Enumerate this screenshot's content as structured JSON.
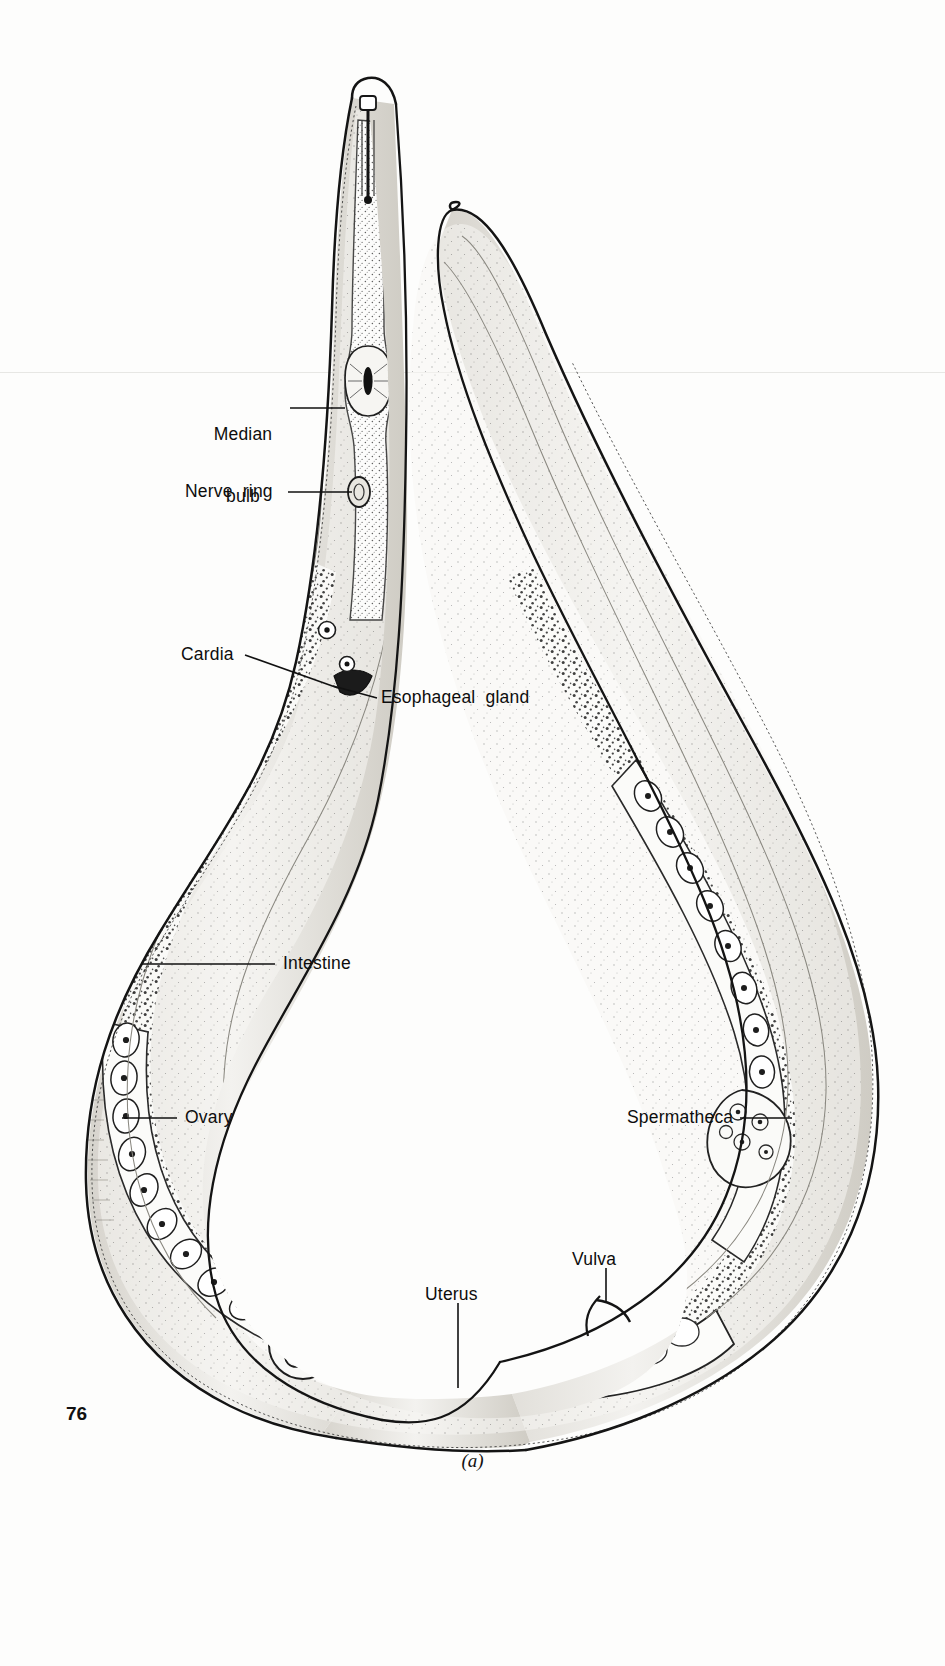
{
  "document": {
    "page_number": "76",
    "figure_caption": "(a)",
    "figure_subject": "female nematode sagittal section"
  },
  "labels": [
    {
      "id": "median-bulb",
      "text_line1": "Median",
      "text_line2": "bulb",
      "x": 213,
      "y": 386,
      "align": "left",
      "leader": {
        "x1": 290,
        "y1": 408,
        "x2": 345,
        "y2": 408
      }
    },
    {
      "id": "nerve-ring",
      "text_line1": "Nerve  ring",
      "text_line2": "",
      "x": 185,
      "y": 482,
      "align": "left",
      "leader": {
        "x1": 288,
        "y1": 492,
        "x2": 352,
        "y2": 492
      }
    },
    {
      "id": "cardia",
      "text_line1": "Cardia",
      "text_line2": "",
      "x": 181,
      "y": 645,
      "align": "left",
      "leader": {
        "x1": 245,
        "y1": 655,
        "x2": 330,
        "y2": 684
      }
    },
    {
      "id": "esophageal-gland",
      "text_line1": "Esophageal  gland",
      "text_line2": "",
      "x": 380,
      "y": 688,
      "align": "left",
      "leader": {
        "x1": 377,
        "y1": 698,
        "x2": 330,
        "y2": 698
      }
    },
    {
      "id": "intestine",
      "text_line1": "Intestine",
      "text_line2": "",
      "x": 282,
      "y": 954,
      "align": "left",
      "leader": {
        "x1": 275,
        "y1": 964,
        "x2": 141,
        "y2": 964
      }
    },
    {
      "id": "ovary",
      "text_line1": "Ovary",
      "text_line2": "",
      "x": 184,
      "y": 1108,
      "align": "left",
      "leader": {
        "x1": 177,
        "y1": 1118,
        "x2": 122,
        "y2": 1118
      }
    },
    {
      "id": "spermatheca",
      "text_line1": "Spermatheca",
      "text_line2": "",
      "x": 627,
      "y": 1108,
      "align": "left",
      "leader": {
        "x1": 740,
        "y1": 1118,
        "x2": 790,
        "y2": 1118
      }
    },
    {
      "id": "vulva",
      "text_line1": "Vulva",
      "text_line2": "",
      "x": 572,
      "y": 1250,
      "align": "left",
      "leader": {
        "x1": 606,
        "y1": 1268,
        "x2": 606,
        "y2": 1300
      }
    },
    {
      "id": "uterus",
      "text_line1": "Uterus",
      "text_line2": "",
      "x": 425,
      "y": 1285,
      "align": "left",
      "leader": {
        "x1": 458,
        "y1": 1303,
        "x2": 458,
        "y2": 1385
      }
    }
  ],
  "colors": {
    "ink": "#111111",
    "outline": "#1a1a1a",
    "fill_light": "#f5f4f1",
    "fill_mid": "#e3e1dc",
    "fill_dark": "#b9b6ae",
    "stipple": "#3a3a3a",
    "paper": "#fdfdfc"
  }
}
